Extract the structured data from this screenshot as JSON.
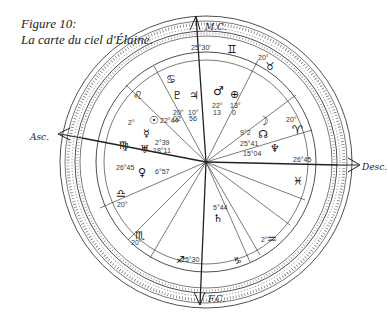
{
  "caption": {
    "figure": "Figure 10:",
    "title": "La carte du ciel d'Élaine."
  },
  "axes": {
    "mc": "M.C.",
    "fc": "F.C.",
    "asc": "Asc.",
    "desc": "Desc."
  },
  "cusps": [
    {
      "id": "mc",
      "degree": "25°30'",
      "sign": "♊"
    },
    {
      "id": "h11",
      "degree": "20°",
      "sign": "♉"
    },
    {
      "id": "h12",
      "degree": "20°",
      "sign": "♈"
    },
    {
      "id": "desc",
      "degree": "26°45",
      "sign": "♓"
    },
    {
      "id": "h5",
      "degree": "2°",
      "sign": "♒"
    },
    {
      "id": "fc",
      "degree": "25°30",
      "sign": "♐"
    },
    {
      "id": "h3",
      "degree": "20°",
      "sign": "♏"
    },
    {
      "id": "h2",
      "degree": "20°",
      "sign": "♎"
    },
    {
      "id": "asc",
      "degree": "26°45",
      "sign": "♍"
    },
    {
      "id": "h9",
      "degree": "2°",
      "sign": "♌"
    },
    {
      "id": "h10b",
      "degree": "",
      "sign": "♋"
    },
    {
      "id": "h6",
      "degree": "",
      "sign": "♑"
    }
  ],
  "planets": [
    {
      "name": "Pluto",
      "glyph": "♇",
      "deg": "20°",
      "min": "02"
    },
    {
      "name": "Jupiter",
      "glyph": "♃",
      "deg": "10°",
      "min": "56"
    },
    {
      "name": "Mars",
      "glyph": "♂",
      "deg": "22°",
      "min": "13"
    },
    {
      "name": "Earth/Part of Fortune",
      "glyph": "⊕",
      "deg": "13°",
      "min": "0"
    },
    {
      "name": "Sun",
      "glyph": "☉",
      "pos": "22°44"
    },
    {
      "name": "Mercury",
      "glyph": "☿",
      "pos": "2°39"
    },
    {
      "name": "Uranus",
      "glyph": "♅",
      "pos": "18°11"
    },
    {
      "name": "Venus",
      "glyph": "♀",
      "pos": "6°57"
    },
    {
      "name": "Moon",
      "glyph": "☽",
      "pos": "9°2"
    },
    {
      "name": "North Node",
      "glyph": "☊",
      "pos": "25°41"
    },
    {
      "name": "Neptune",
      "glyph": "♆",
      "pos": "15°04"
    },
    {
      "name": "Saturn",
      "glyph": "♄",
      "pos": "5°44"
    }
  ],
  "colors": {
    "ink": "#1a1a1a",
    "paper": "#ffffff"
  }
}
